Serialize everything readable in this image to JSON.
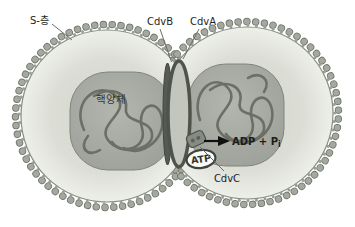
{
  "diagram": {
    "type": "archaeal-cell-division-cdv-machinery",
    "labels": {
      "s_layer": "S-층",
      "cdvb": "CdvB",
      "cdva": "CdvA",
      "cdvc": "CdvC",
      "nucleoid": "핵양체",
      "atp": "ATP",
      "adp_main": "ADP + P",
      "adp_subscript": "i"
    },
    "colors": {
      "background": "#ffffff",
      "bead_fill": "#a4a9a0",
      "bead_outline": "#6e7369",
      "stem": "#9aa096",
      "membrane": "#898d84",
      "nucleoid_stroke": "#80847a",
      "dna_strand": "#6b6f65",
      "ring_stroke": "#4f544a",
      "ring_fill": "#c3c6bd",
      "ring_band": "#565b51",
      "cdvc_fill": "#878c82",
      "cdvc_stroke": "#4e524a",
      "arrow": "#111111",
      "atp_fill": "#fafaf8",
      "atp_stroke": "#3f443b",
      "label_text": "#1f1f1f"
    }
  }
}
